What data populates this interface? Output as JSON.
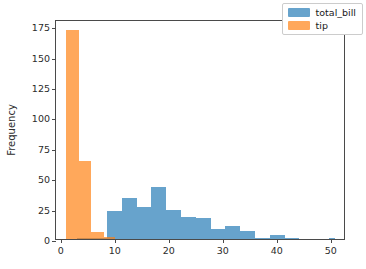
{
  "chart_data": {
    "type": "bar",
    "chart_subtype": "histogram-overlay",
    "title": "",
    "xlabel": "",
    "ylabel": "Frequency",
    "xlim": [
      -0.9,
      52.8
    ],
    "ylim": [
      0,
      181
    ],
    "grid": false,
    "legend_position": "upper right",
    "xticks": [
      0,
      10,
      20,
      30,
      40,
      50
    ],
    "xtick_labels": [
      "0",
      "10",
      "20",
      "30",
      "40",
      "50"
    ],
    "yticks": [
      0,
      25,
      50,
      75,
      100,
      125,
      150,
      175
    ],
    "ytick_labels": [
      "0",
      "25",
      "50",
      "75",
      "100",
      "125",
      "150",
      "175"
    ],
    "series": [
      {
        "name": "total_bill",
        "color": "#1f77b4",
        "alpha": 0.68,
        "bin_edges": [
          3.07,
          5.81,
          8.55,
          11.29,
          14.03,
          16.77,
          19.51,
          22.25,
          24.99,
          27.73,
          30.47,
          33.21,
          35.95,
          38.69,
          41.43,
          44.17,
          46.91,
          49.65,
          50.81
        ],
        "bins": [
          {
            "left": 3.07,
            "right": 5.81,
            "count": 1
          },
          {
            "left": 5.81,
            "right": 8.55,
            "count": 1
          },
          {
            "left": 8.55,
            "right": 11.29,
            "count": 23
          },
          {
            "left": 11.29,
            "right": 14.03,
            "count": 34
          },
          {
            "left": 14.03,
            "right": 16.77,
            "count": 26
          },
          {
            "left": 16.77,
            "right": 19.51,
            "count": 43
          },
          {
            "left": 19.51,
            "right": 22.25,
            "count": 24
          },
          {
            "left": 22.25,
            "right": 24.99,
            "count": 18
          },
          {
            "left": 24.99,
            "right": 27.73,
            "count": 17
          },
          {
            "left": 27.73,
            "right": 30.47,
            "count": 8
          },
          {
            "left": 30.47,
            "right": 33.21,
            "count": 11
          },
          {
            "left": 33.21,
            "right": 35.95,
            "count": 7
          },
          {
            "left": 35.95,
            "right": 38.69,
            "count": 1
          },
          {
            "left": 38.69,
            "right": 41.43,
            "count": 3
          },
          {
            "left": 41.43,
            "right": 44.17,
            "count": 1
          },
          {
            "left": 44.17,
            "right": 46.91,
            "count": 0
          },
          {
            "left": 46.91,
            "right": 49.65,
            "count": 0
          },
          {
            "left": 49.65,
            "right": 50.81,
            "count": 1
          }
        ]
      },
      {
        "name": "tip",
        "color": "#ff7f0e",
        "alpha": 0.68,
        "bin_edges": [
          1.0,
          3.3,
          5.6,
          7.9,
          10.0
        ],
        "bins": [
          {
            "left": 1.0,
            "right": 3.3,
            "count": 172
          },
          {
            "left": 3.3,
            "right": 5.6,
            "count": 64
          },
          {
            "left": 5.6,
            "right": 7.9,
            "count": 6
          },
          {
            "left": 7.9,
            "right": 10.0,
            "count": 2
          }
        ]
      }
    ]
  },
  "legend": {
    "entries": [
      {
        "label": "total_bill"
      },
      {
        "label": "tip"
      }
    ]
  }
}
